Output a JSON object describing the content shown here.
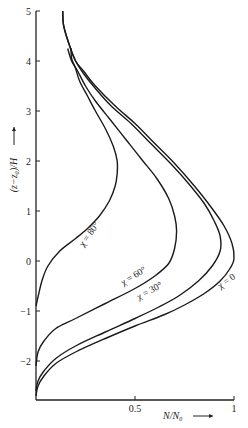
{
  "chart_data": {
    "type": "line",
    "title": "",
    "xlabel": "N/N₀",
    "ylabel": "(z−z₀)/H",
    "xlim": [
      0,
      1
    ],
    "ylim": [
      -2.8,
      5
    ],
    "x_ticks": [
      {
        "value": 0.5,
        "label": "0.5"
      },
      {
        "value": 1,
        "label": "1"
      }
    ],
    "y_ticks": [
      {
        "value": 5,
        "label": "5"
      },
      {
        "value": 4,
        "label": "4"
      },
      {
        "value": 3,
        "label": "3"
      },
      {
        "value": 2,
        "label": "2"
      },
      {
        "value": 1,
        "label": "1"
      },
      {
        "value": 0,
        "label": "0"
      },
      {
        "value": -1,
        "label": "−1"
      },
      {
        "value": -2,
        "label": "−2"
      }
    ],
    "grid": false,
    "legend": "inline curve labels",
    "series": [
      {
        "name": "χ = 0",
        "label_pos": {
          "x": 0.97,
          "z": -0.45,
          "angle": -35
        },
        "points": [
          [
            0.0,
            -2.7
          ],
          [
            0.01,
            -2.5
          ],
          [
            0.04,
            -2.3
          ],
          [
            0.1,
            -2.05
          ],
          [
            0.2,
            -1.82
          ],
          [
            0.35,
            -1.55
          ],
          [
            0.5,
            -1.3
          ],
          [
            0.65,
            -1.07
          ],
          [
            0.75,
            -0.88
          ],
          [
            0.85,
            -0.65
          ],
          [
            0.93,
            -0.4
          ],
          [
            0.98,
            -0.15
          ],
          [
            1.0,
            0.05
          ],
          [
            0.99,
            0.35
          ],
          [
            0.95,
            0.7
          ],
          [
            0.88,
            1.1
          ],
          [
            0.8,
            1.5
          ],
          [
            0.7,
            1.95
          ],
          [
            0.6,
            2.35
          ],
          [
            0.5,
            2.75
          ],
          [
            0.4,
            3.1
          ],
          [
            0.3,
            3.5
          ],
          [
            0.24,
            3.8
          ],
          [
            0.2,
            4.0
          ],
          [
            0.17,
            4.3
          ],
          [
            0.14,
            4.7
          ],
          [
            0.135,
            5.0
          ]
        ]
      },
      {
        "name": "χ = 30°",
        "label_pos": {
          "x": 0.58,
          "z": -0.65,
          "angle": -28
        },
        "points": [
          [
            0.0,
            -2.6
          ],
          [
            0.01,
            -2.4
          ],
          [
            0.04,
            -2.2
          ],
          [
            0.1,
            -1.95
          ],
          [
            0.2,
            -1.7
          ],
          [
            0.35,
            -1.42
          ],
          [
            0.5,
            -1.15
          ],
          [
            0.62,
            -0.92
          ],
          [
            0.72,
            -0.7
          ],
          [
            0.82,
            -0.4
          ],
          [
            0.89,
            -0.1
          ],
          [
            0.93,
            0.2
          ],
          [
            0.93,
            0.5
          ],
          [
            0.9,
            0.8
          ],
          [
            0.85,
            1.15
          ],
          [
            0.77,
            1.55
          ],
          [
            0.68,
            1.95
          ],
          [
            0.58,
            2.35
          ],
          [
            0.48,
            2.75
          ],
          [
            0.38,
            3.1
          ],
          [
            0.3,
            3.45
          ],
          [
            0.24,
            3.75
          ],
          [
            0.2,
            4.0
          ],
          [
            0.17,
            4.3
          ],
          [
            0.14,
            4.7
          ],
          [
            0.135,
            5.0
          ]
        ]
      },
      {
        "name": "χ = 60°",
        "label_pos": {
          "x": 0.5,
          "z": -0.35,
          "angle": -32
        },
        "points": [
          [
            0.0,
            -2.1
          ],
          [
            0.01,
            -1.82
          ],
          [
            0.04,
            -1.6
          ],
          [
            0.1,
            -1.35
          ],
          [
            0.2,
            -1.15
          ],
          [
            0.35,
            -0.85
          ],
          [
            0.5,
            -0.55
          ],
          [
            0.6,
            -0.3
          ],
          [
            0.67,
            -0.05
          ],
          [
            0.7,
            0.25
          ],
          [
            0.71,
            0.6
          ],
          [
            0.7,
            0.9
          ],
          [
            0.67,
            1.25
          ],
          [
            0.61,
            1.65
          ],
          [
            0.53,
            2.05
          ],
          [
            0.45,
            2.45
          ],
          [
            0.37,
            2.85
          ],
          [
            0.3,
            3.2
          ],
          [
            0.25,
            3.5
          ],
          [
            0.21,
            3.8
          ],
          [
            0.18,
            4.0
          ],
          [
            0.16,
            4.25
          ]
        ]
      },
      {
        "name": "χ = 80°",
        "label_pos": {
          "x": 0.28,
          "z": 0.5,
          "angle": -55
        },
        "points": [
          [
            0.0,
            -0.9
          ],
          [
            0.01,
            -0.72
          ],
          [
            0.03,
            -0.4
          ],
          [
            0.06,
            -0.1
          ],
          [
            0.12,
            0.2
          ],
          [
            0.2,
            0.45
          ],
          [
            0.26,
            0.65
          ],
          [
            0.32,
            0.9
          ],
          [
            0.37,
            1.2
          ],
          [
            0.4,
            1.5
          ],
          [
            0.41,
            1.75
          ],
          [
            0.41,
            2.0
          ],
          [
            0.39,
            2.3
          ],
          [
            0.35,
            2.65
          ],
          [
            0.3,
            3.0
          ],
          [
            0.26,
            3.3
          ],
          [
            0.22,
            3.6
          ],
          [
            0.2,
            3.85
          ],
          [
            0.18,
            4.05
          ],
          [
            0.177,
            4.26
          ]
        ]
      }
    ]
  }
}
